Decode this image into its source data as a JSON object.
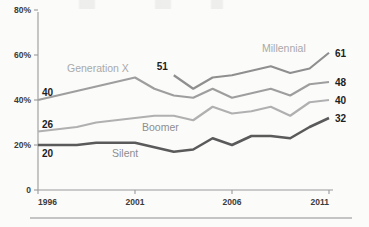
{
  "chart_data": {
    "type": "line",
    "title": "",
    "xlabel": "",
    "ylabel": "",
    "x": [
      1996,
      1997,
      1998,
      1999,
      2000,
      2001,
      2002,
      2003,
      2004,
      2005,
      2006,
      2007,
      2008,
      2009,
      2010,
      2011
    ],
    "xlim": [
      1996,
      2011
    ],
    "ylim": [
      0,
      80
    ],
    "grid": false,
    "legend": "inline-labels",
    "x_tick_labels": [
      "1996",
      "2001",
      "2006",
      "2011"
    ],
    "x_tick_values": [
      1996,
      2001,
      2006,
      2011
    ],
    "y_tick_labels": [
      "0",
      "20%",
      "40%",
      "60%",
      "80%"
    ],
    "y_tick_values": [
      0,
      20,
      40,
      60,
      80
    ],
    "series": [
      {
        "name": "Millennial",
        "color": "#8f8f8f",
        "start_value_label": "51",
        "end_value_label": "61",
        "x": [
          2003,
          2004,
          2005,
          2006,
          2007,
          2008,
          2009,
          2010,
          2011
        ],
        "values": [
          51,
          45,
          50,
          51,
          53,
          55,
          52,
          54,
          61
        ]
      },
      {
        "name": "Generation X",
        "color": "#9e9e9e",
        "start_value_label": "40",
        "end_value_label": "48",
        "x": [
          1996,
          1997,
          1998,
          1999,
          2000,
          2001,
          2002,
          2003,
          2004,
          2005,
          2006,
          2007,
          2008,
          2009,
          2010,
          2011
        ],
        "values": [
          40,
          42,
          44,
          46,
          48,
          50,
          45,
          42,
          41,
          45,
          41,
          43,
          45,
          42,
          47,
          48
        ]
      },
      {
        "name": "Boomer",
        "color": "#b0b0b0",
        "start_value_label": "26",
        "end_value_label": "40",
        "x": [
          1996,
          1997,
          1998,
          1999,
          2000,
          2001,
          2002,
          2003,
          2004,
          2005,
          2006,
          2007,
          2008,
          2009,
          2010,
          2011
        ],
        "values": [
          26,
          27,
          28,
          30,
          31,
          32,
          33,
          33,
          31,
          37,
          34,
          35,
          37,
          33,
          39,
          40
        ]
      },
      {
        "name": "Silent",
        "color": "#5a5a5a",
        "start_value_label": "20",
        "end_value_label": "32",
        "x": [
          1996,
          1997,
          1998,
          1999,
          2000,
          2001,
          2002,
          2003,
          2004,
          2005,
          2006,
          2007,
          2008,
          2009,
          2010,
          2011
        ],
        "values": [
          20,
          20,
          20,
          21,
          21,
          21,
          19,
          17,
          18,
          23,
          20,
          24,
          24,
          23,
          28,
          32
        ]
      }
    ],
    "series_label_positions": [
      {
        "name": "Millennial",
        "x": 262,
        "y": 52
      },
      {
        "name": "Generation X",
        "x": 67,
        "y": 72
      },
      {
        "name": "Boomer",
        "x": 142,
        "y": 131
      },
      {
        "name": "Silent",
        "x": 112,
        "y": 157
      }
    ]
  }
}
